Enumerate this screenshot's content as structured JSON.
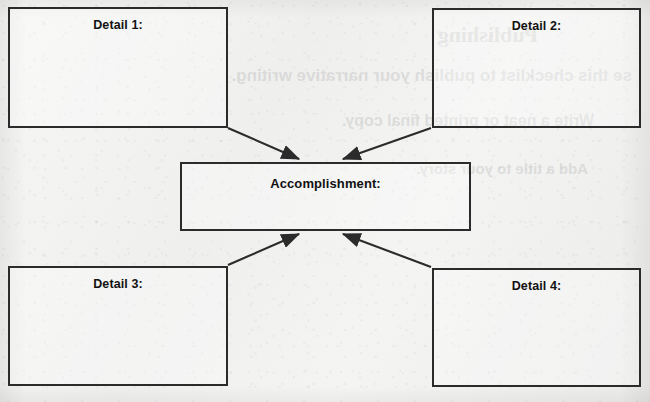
{
  "worksheet": {
    "type": "graphic-organizer",
    "center": {
      "label": "Accomplishment:",
      "name": "accomplishment"
    },
    "details": [
      {
        "id": "detail-1",
        "label": "Detail 1:",
        "position": "top-left"
      },
      {
        "id": "detail-2",
        "label": "Detail 2:",
        "position": "top-right"
      },
      {
        "id": "detail-3",
        "label": "Detail 3:",
        "position": "bottom-left"
      },
      {
        "id": "detail-4",
        "label": "Detail 4:",
        "position": "bottom-right"
      }
    ],
    "arrows": [
      {
        "from": "detail-1",
        "to": "accomplishment"
      },
      {
        "from": "detail-2",
        "to": "accomplishment"
      },
      {
        "from": "detail-3",
        "to": "accomplishment"
      },
      {
        "from": "detail-4",
        "to": "accomplishment"
      }
    ],
    "colors": {
      "paper": "#f3f3f2",
      "ink": "#2b2b2b",
      "text": "#111111"
    }
  },
  "bleed_through": {
    "note": "faint mirrored text showing through from the reverse side of the page",
    "lines": [
      "Publishing",
      "se this checklist to publish your narrative writing.",
      "Write a neat or printed final copy.",
      "Add a title to your story."
    ]
  }
}
